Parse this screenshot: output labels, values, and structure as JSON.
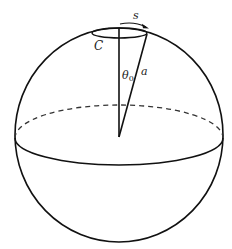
{
  "diagram": {
    "type": "sphere-cone-geometry",
    "stroke_color": "#111111",
    "background": "#ffffff",
    "labels": {
      "arc_length": "s",
      "circle": "C",
      "angle": "θ",
      "angle_subscript": "0",
      "radius": "a"
    },
    "elements": [
      "sphere outline",
      "equator (front solid, back dashed)",
      "small circle C near north pole",
      "vertical axis from center to pole",
      "cone edge from center to circle C",
      "arc arrow s along circle"
    ]
  }
}
